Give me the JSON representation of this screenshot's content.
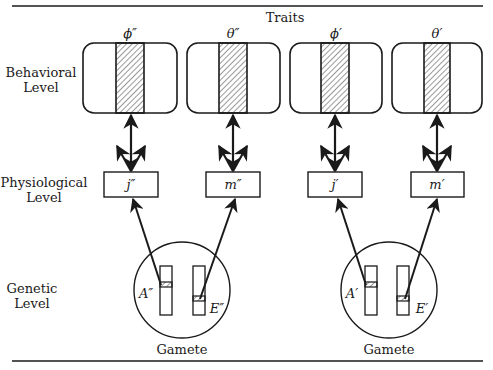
{
  "figure": {
    "header": "Traits",
    "levels": [
      {
        "id": "behavioral",
        "line1": "Behavioral",
        "line2": "Level"
      },
      {
        "id": "physiological",
        "line1": "Physiological",
        "line2": "Level"
      },
      {
        "id": "genetic",
        "line1": "Genetic",
        "line2": "Level"
      }
    ],
    "traits": [
      {
        "label": "ϕ″"
      },
      {
        "label": "θ″"
      },
      {
        "label": "ϕ′"
      },
      {
        "label": "θ′"
      }
    ],
    "physiological_nodes": [
      {
        "label": "j″"
      },
      {
        "label": "m″"
      },
      {
        "label": "j′"
      },
      {
        "label": "m′"
      }
    ],
    "gametes": [
      {
        "caption": "Gamete",
        "gene_a": "A″",
        "gene_e": "E″"
      },
      {
        "caption": "Gamete",
        "gene_a": "A′",
        "gene_e": "E′"
      }
    ],
    "colors": {
      "ink": "#1a1a1a",
      "background": "#ffffff"
    }
  }
}
